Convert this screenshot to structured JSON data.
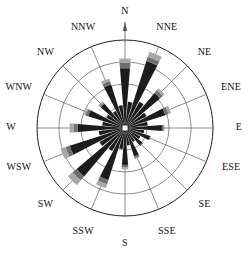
{
  "figure": {
    "center": {
      "x": 125,
      "y": 128
    },
    "outer_radius": 88
  },
  "labels": {
    "n": "N",
    "nne": "NNE",
    "ne": "NE",
    "ene": "ENE",
    "e": "E",
    "ese": "ESE",
    "se": "SE",
    "sse": "SSE",
    "s": "S",
    "ssw": "SSW",
    "sw": "SW",
    "wsw": "WSW",
    "w": "W",
    "wnw": "WNW",
    "nw": "NW",
    "nnw": "NNW"
  },
  "colors": {
    "dark": "#1c1c1c",
    "mid": "#6f6f6f",
    "light": "#a8a8a8",
    "grid": "#5a5a5a",
    "outline": "#1e1e1e",
    "background": "#ffffff"
  },
  "chart_data": {
    "type": "bar",
    "subtype": "wind-rose-polar-bar",
    "xlabel": "",
    "ylabel": "",
    "grid": true,
    "legend_position": "none",
    "angular_unit": "degrees-clockwise-from-north",
    "sector_count": 32,
    "sector_width_deg": 11.25,
    "radial_rings": [
      0.25,
      0.5,
      0.75,
      1.0
    ],
    "rlim": [
      0,
      1.0
    ],
    "stack_names": [
      "dark",
      "mid",
      "light"
    ],
    "categories": [
      "N",
      "N/NNE",
      "NNE",
      "NNE/NE",
      "NE",
      "NE/ENE",
      "ENE",
      "ENE/E",
      "E",
      "E/ESE",
      "ESE",
      "ESE/SE",
      "SE",
      "SE/SSE",
      "SSE",
      "SSE/S",
      "S",
      "S/SSW",
      "SSW",
      "SSW/SW",
      "SW",
      "SW/WSW",
      "WSW",
      "WSW/W",
      "W",
      "W/WNW",
      "WNW",
      "WNW/NW",
      "NW",
      "NW/NNW",
      "NNW",
      "NNW/N"
    ],
    "azimuths": [
      0,
      11.25,
      22.5,
      33.75,
      45,
      56.25,
      67.5,
      78.75,
      90,
      101.25,
      112.5,
      123.75,
      135,
      146.25,
      157.5,
      168.75,
      180,
      191.25,
      202.5,
      213.75,
      225,
      236.25,
      247.5,
      258.75,
      270,
      281.25,
      292.5,
      303.75,
      315,
      326.25,
      337.5,
      348.75
    ],
    "series": [
      {
        "name": "dark",
        "values": [
          0.68,
          0.3,
          0.8,
          0.34,
          0.52,
          0.28,
          0.48,
          0.26,
          0.42,
          0.22,
          0.3,
          0.2,
          0.26,
          0.18,
          0.34,
          0.2,
          0.42,
          0.24,
          0.62,
          0.3,
          0.72,
          0.33,
          0.66,
          0.3,
          0.54,
          0.26,
          0.44,
          0.24,
          0.36,
          0.22,
          0.52,
          0.26
        ]
      },
      {
        "name": "mid",
        "values": [
          0.06,
          0.0,
          0.05,
          0.0,
          0.04,
          0.0,
          0.04,
          0.0,
          0.02,
          0.0,
          0.01,
          0.0,
          0.01,
          0.0,
          0.02,
          0.0,
          0.03,
          0.0,
          0.05,
          0.0,
          0.06,
          0.0,
          0.05,
          0.0,
          0.04,
          0.0,
          0.03,
          0.0,
          0.02,
          0.0,
          0.04,
          0.0
        ]
      },
      {
        "name": "light",
        "values": [
          0.05,
          0.0,
          0.06,
          0.0,
          0.03,
          0.0,
          0.03,
          0.0,
          0.01,
          0.0,
          0.0,
          0.0,
          0.0,
          0.0,
          0.01,
          0.0,
          0.02,
          0.0,
          0.05,
          0.0,
          0.07,
          0.0,
          0.06,
          0.0,
          0.05,
          0.0,
          0.02,
          0.0,
          0.02,
          0.0,
          0.03,
          0.0
        ]
      }
    ]
  }
}
